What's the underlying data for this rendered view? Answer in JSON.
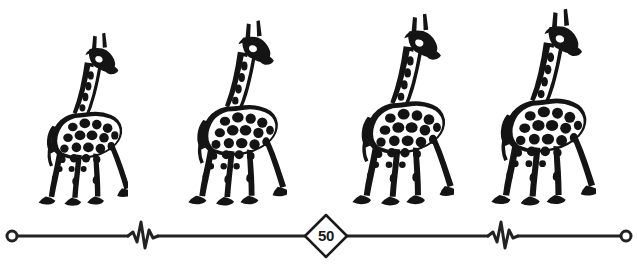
{
  "canvas": {
    "width": 637,
    "height": 280,
    "background_color": "#ffffff",
    "ink_color": "#1a1a1a"
  },
  "illustration": {
    "subject": "giraffe",
    "style": "black-and-white line art",
    "count": 4,
    "description": "Four giraffes of progressively increasing height standing in a row above a measurement scale line",
    "figures": [
      {
        "index": 1,
        "name": "giraffe-1",
        "left": 26,
        "width": 102,
        "height": 183,
        "relative_size": 0.885
      },
      {
        "index": 2,
        "name": "giraffe-2",
        "left": 172,
        "width": 115,
        "height": 196,
        "relative_size": 0.945
      },
      {
        "index": 3,
        "name": "giraffe-3",
        "left": 336,
        "width": 118,
        "height": 203,
        "relative_size": 0.975
      },
      {
        "index": 4,
        "name": "giraffe-4",
        "left": 474,
        "width": 122,
        "height": 208,
        "relative_size": 1.0
      }
    ]
  },
  "scale": {
    "name": "measurement-scale",
    "axis_y": 236,
    "line_color": "#222222",
    "line_width": 3,
    "start_x": 12,
    "end_x": 626,
    "endpoints": [
      {
        "name": "scale-endpoint-left",
        "shape": "open-circle",
        "x": 12,
        "radius": 5
      },
      {
        "name": "scale-endpoint-right",
        "shape": "open-circle",
        "x": 626,
        "radius": 5
      }
    ],
    "breaks": [
      {
        "name": "scale-break-left",
        "shape": "zigzag",
        "x": 141
      },
      {
        "name": "scale-break-right",
        "shape": "zigzag",
        "x": 501
      }
    ],
    "marker": {
      "name": "scale-marker-50",
      "shape": "diamond",
      "center_x": 326,
      "center_y": 236,
      "size": 42,
      "value": "50",
      "fill": "#ffffff",
      "stroke": "#1a1a1a"
    }
  }
}
